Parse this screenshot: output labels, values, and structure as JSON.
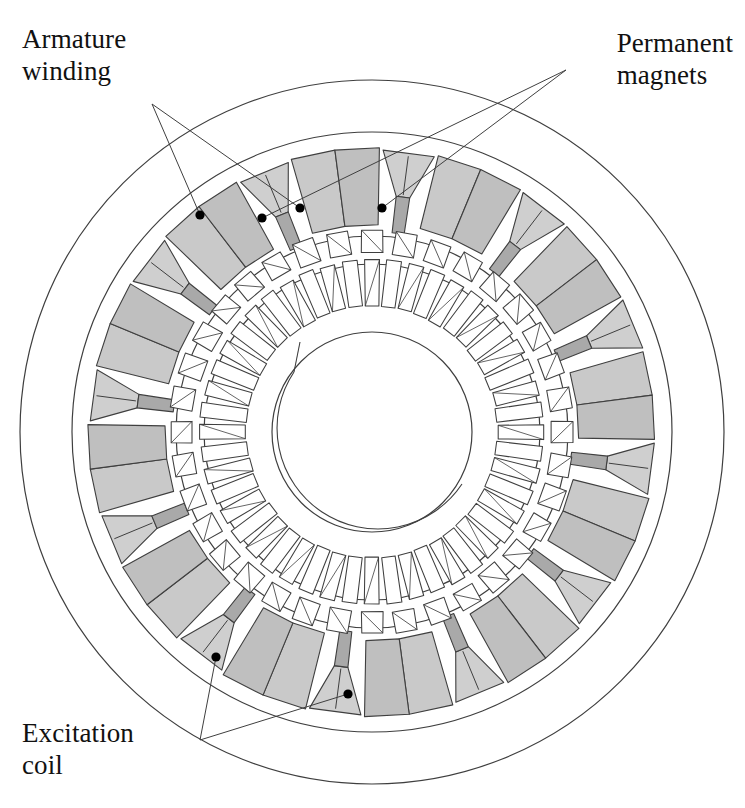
{
  "figure": {
    "kind": "cross-section-diagram",
    "background": "#ffffff",
    "line_color": "#4a4a4a",
    "center": {
      "x": 372,
      "y": 432
    },
    "circles": {
      "housing_outer_r": 352,
      "yoke_outer_r": 300,
      "stator_bore_r": 196,
      "rotor_outer_r": 168,
      "rotor_inner_r": 120,
      "shaft_r": 100,
      "shaft_crescent_r": 97
    },
    "colors": {
      "coil_fill": "#c9c9c9",
      "coil_fill_alt": "#bfbfbf",
      "magnet_fill": "#cfcfcf",
      "magnet_stem_fill": "#a9a9a9",
      "tooth_fill": "#ffffff",
      "outline": "#3f3f3f",
      "dot": "#000000"
    },
    "counts": {
      "armature_coil_blocks": 12,
      "magnet_wedges": 12,
      "rotor_teeth": 48,
      "stator_slot_bars": 36
    }
  },
  "labels": {
    "armature_winding": {
      "text": "Armature\nwinding",
      "anchor_x": 150,
      "anchor_y": 100
    },
    "permanent_magnets": {
      "text": "Permanent\nmagnets",
      "anchor_x": 578,
      "anchor_y": 68
    },
    "excitation_coil": {
      "text": "Excitation\ncoil",
      "anchor_x": 196,
      "anchor_y": 744
    }
  },
  "leaders": [
    {
      "name": "armature-leader-1",
      "from_x": 152,
      "from_y": 104,
      "to_x": 300,
      "to_y": 208
    },
    {
      "name": "armature-leader-2",
      "from_x": 152,
      "from_y": 104,
      "to_x": 200,
      "to_y": 215
    },
    {
      "name": "magnets-leader-1",
      "from_x": 566,
      "from_y": 70,
      "to_x": 382,
      "to_y": 208
    },
    {
      "name": "magnets-leader-2",
      "from_x": 566,
      "from_y": 70,
      "to_x": 262,
      "to_y": 218
    },
    {
      "name": "excitation-leader-1",
      "from_x": 200,
      "from_y": 740,
      "to_x": 216,
      "to_y": 657
    },
    {
      "name": "excitation-leader-2",
      "from_x": 200,
      "from_y": 740,
      "to_x": 348,
      "to_y": 694
    }
  ],
  "callout_dots": [
    {
      "name": "armature-dot-a",
      "x": 200,
      "y": 215,
      "target": "armature_winding"
    },
    {
      "name": "armature-dot-b",
      "x": 300,
      "y": 208,
      "target": "armature_winding"
    },
    {
      "name": "magnet-dot-a",
      "x": 262,
      "y": 218,
      "target": "permanent_magnets"
    },
    {
      "name": "magnet-dot-b",
      "x": 382,
      "y": 208,
      "target": "permanent_magnets"
    },
    {
      "name": "excitation-dot-a",
      "x": 216,
      "y": 657,
      "target": "excitation_coil"
    },
    {
      "name": "excitation-dot-b",
      "x": 348,
      "y": 694,
      "target": "excitation_coil"
    }
  ]
}
